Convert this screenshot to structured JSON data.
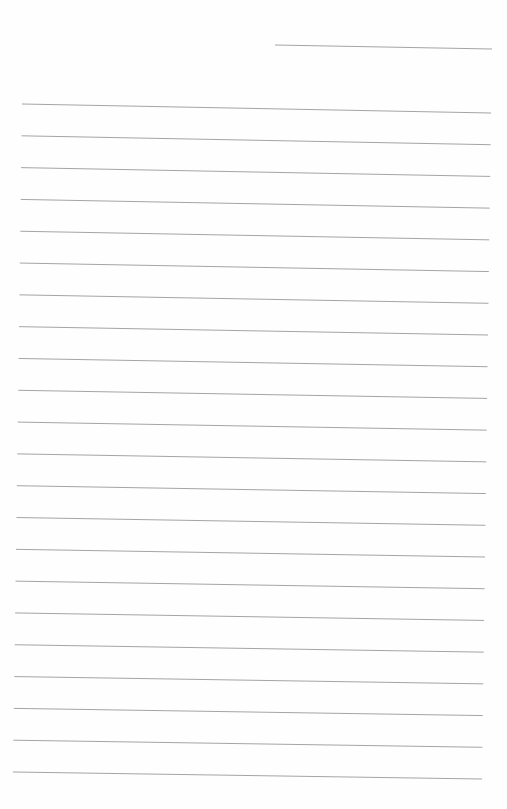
{
  "page": {
    "type": "ruled-sheet",
    "background": "#fefefe",
    "line_color": "#9a9a9a",
    "header_line": {
      "x1": 275,
      "y1": 45,
      "x2": 492,
      "y2": 49
    },
    "ruled_lines": {
      "count": 22,
      "first": {
        "x1": 22,
        "y1": 104,
        "x2": 491,
        "y2": 113
      },
      "last": {
        "x1": 13,
        "y1": 772,
        "x2": 482,
        "y2": 779
      }
    }
  }
}
